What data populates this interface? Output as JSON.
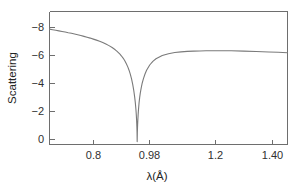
{
  "chart_data": {
    "type": "line",
    "title": "",
    "xlabel": "λ(Å)",
    "ylabel": "Scattering",
    "xlim": [
      0.7,
      1.46
    ],
    "ylim": [
      0.6,
      -8.6
    ],
    "y_axis_inverted": true,
    "grid": false,
    "legend": null,
    "xticks": [
      0.8,
      0.98,
      1.2,
      1.4
    ],
    "xtick_labels": [
      "0.8",
      "0.98",
      "1.2",
      "1.40"
    ],
    "yticks": [
      0,
      -2,
      -4,
      -6,
      -8
    ],
    "ytick_labels": [
      "0",
      "−2",
      "−4",
      "−6",
      "−8"
    ],
    "resonance_center": 0.98,
    "peak_value": -8.4,
    "series": [
      {
        "name": "Scattering",
        "color": "#7a7a7a",
        "x": [
          0.7,
          0.71,
          0.72,
          0.73,
          0.74,
          0.75,
          0.76,
          0.77,
          0.78,
          0.79,
          0.8,
          0.81,
          0.82,
          0.83,
          0.84,
          0.85,
          0.86,
          0.87,
          0.88,
          0.89,
          0.9,
          0.91,
          0.915,
          0.92,
          0.925,
          0.93,
          0.935,
          0.94,
          0.945,
          0.95,
          0.954,
          0.958,
          0.962,
          0.966,
          0.969,
          0.972,
          0.974,
          0.976,
          0.977,
          0.978,
          0.9785,
          0.979,
          0.9795,
          0.98,
          0.9805,
          0.981,
          0.9815,
          0.982,
          0.983,
          0.984,
          0.986,
          0.988,
          0.99,
          0.993,
          0.996,
          1.0,
          1.005,
          1.01,
          1.02,
          1.03,
          1.04,
          1.06,
          1.08,
          1.1,
          1.12,
          1.14,
          1.16,
          1.18,
          1.2,
          1.24,
          1.28,
          1.32,
          1.36,
          1.4,
          1.43,
          1.46
        ],
        "y": [
          -0.62,
          -0.66,
          -0.7,
          -0.74,
          -0.78,
          -0.82,
          -0.87,
          -0.91,
          -0.96,
          -1.01,
          -1.06,
          -1.12,
          -1.18,
          -1.24,
          -1.31,
          -1.38,
          -1.46,
          -1.55,
          -1.65,
          -1.76,
          -1.89,
          -2.05,
          -2.14,
          -2.24,
          -2.35,
          -2.48,
          -2.62,
          -2.79,
          -2.99,
          -3.23,
          -3.46,
          -3.73,
          -4.06,
          -4.47,
          -4.85,
          -5.32,
          -5.7,
          -6.18,
          -6.48,
          -6.86,
          -7.1,
          -7.38,
          -7.72,
          -8.4,
          -7.8,
          -7.45,
          -7.18,
          -6.95,
          -6.55,
          -6.22,
          -5.72,
          -5.34,
          -5.03,
          -4.66,
          -4.36,
          -4.04,
          -3.72,
          -3.47,
          -3.1,
          -2.85,
          -2.67,
          -2.45,
          -2.32,
          -2.24,
          -2.19,
          -2.16,
          -2.14,
          -2.13,
          -2.12,
          -2.11,
          -2.12,
          -2.14,
          -2.17,
          -2.2,
          -2.22,
          -2.25
        ]
      }
    ]
  },
  "axes": {
    "y_label": "Scattering",
    "x_label": "λ(Å)",
    "x_tick_labels": [
      "0.8",
      "0.98",
      "1.2",
      "1.40"
    ],
    "y_tick_labels": [
      "0",
      "−2",
      "−4",
      "−6",
      "−8"
    ]
  },
  "colors": {
    "curve": "#7a7a7a",
    "frame": "#6e6e6e",
    "text": "#242424",
    "background": "#ffffff"
  }
}
